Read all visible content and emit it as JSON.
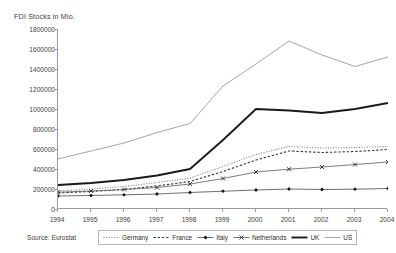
{
  "chart_data": {
    "type": "line",
    "title": "FDI Stocks in Mio.",
    "xlabel": "",
    "ylabel": "FDI Stocks in Mio.",
    "x": [
      1994,
      1995,
      1996,
      1997,
      1998,
      1999,
      2000,
      2001,
      2002,
      2003,
      2004
    ],
    "categories": [
      "1994",
      "1995",
      "1996",
      "1997",
      "1998",
      "1999",
      "2000",
      "2001",
      "2002",
      "2003",
      "2004"
    ],
    "ylim": [
      0,
      1800000
    ],
    "yticks": [
      0,
      200000,
      400000,
      600000,
      800000,
      1000000,
      1200000,
      1400000,
      1600000,
      1800000
    ],
    "ytick_labels": [
      "0",
      "200000",
      "400000",
      "600000",
      "800000",
      "1000000",
      "1200000",
      "1400000",
      "1600000",
      "1800000"
    ],
    "grid": false,
    "legend_position": "bottom",
    "series": [
      {
        "name": "Germany",
        "style": "dotted",
        "marker": "none",
        "color": "#7d7d7d",
        "values": [
          180000,
          200000,
          225000,
          265000,
          310000,
          425000,
          545000,
          625000,
          610000,
          615000,
          625000
        ]
      },
      {
        "name": "France",
        "style": "dashed",
        "marker": "none",
        "color": "#3a3a3a",
        "values": [
          160000,
          175000,
          195000,
          230000,
          275000,
          375000,
          490000,
          580000,
          565000,
          575000,
          595000
        ]
      },
      {
        "name": "Italy",
        "style": "solid-marker",
        "marker": "diamond",
        "color": "#4a4a4a",
        "values": [
          130000,
          135000,
          142000,
          150000,
          165000,
          178000,
          190000,
          200000,
          195000,
          198000,
          205000
        ]
      },
      {
        "name": "Netherlands",
        "style": "solid-marker",
        "marker": "cross",
        "color": "#5a5a5a",
        "values": [
          168000,
          180000,
          195000,
          215000,
          250000,
          305000,
          370000,
          398000,
          420000,
          445000,
          470000
        ]
      },
      {
        "name": "UK",
        "style": "thick-solid",
        "marker": "none",
        "color": "#1a1a1a",
        "values": [
          240000,
          260000,
          290000,
          335000,
          400000,
          690000,
          1000000,
          985000,
          960000,
          1000000,
          1060000
        ]
      },
      {
        "name": "US",
        "style": "thin-solid",
        "marker": "none",
        "color": "#8e8e8e",
        "values": [
          500000,
          580000,
          660000,
          765000,
          855000,
          1230000,
          1450000,
          1680000,
          1540000,
          1425000,
          1520000
        ]
      }
    ]
  },
  "source": {
    "label": "Source: Eurostat"
  },
  "legend": {
    "entries": [
      {
        "label": "Germany"
      },
      {
        "label": "France"
      },
      {
        "label": "Italy"
      },
      {
        "label": "Netherlands"
      },
      {
        "label": "UK"
      },
      {
        "label": "US"
      }
    ]
  }
}
